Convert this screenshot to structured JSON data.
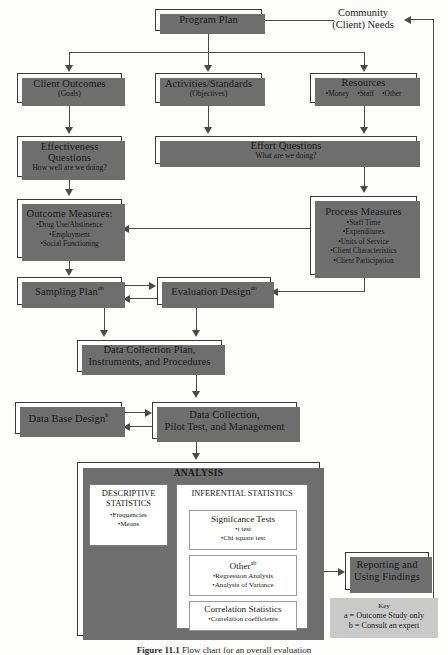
{
  "diagram": {
    "caption_label": "Figure 11.1",
    "caption_text": "Flow chart for an overall evaluation"
  },
  "nodes": {
    "program_plan": {
      "title": "Program Plan"
    },
    "community_needs": {
      "line1": "Community",
      "line2": "(Client) Needs"
    },
    "client_outcomes": {
      "title": "Client Outcomes",
      "sub": "(Goals)"
    },
    "activities_standards": {
      "title": "Activities/Standards",
      "sub": "(Objectives)"
    },
    "resources": {
      "title": "Resources",
      "bullets": [
        "•Money",
        "•Staff",
        "•Other"
      ]
    },
    "effectiveness_questions": {
      "line1": "Effectiveness",
      "line2": "Questions",
      "sub": "How well are we doing?"
    },
    "effort_questions": {
      "title": "Effort Questions",
      "sub": "What are we doing?"
    },
    "outcome_measures": {
      "title": "Outcome Measures:",
      "bullets": [
        "•Drug Use/Abstinence",
        "•Employment",
        "•Social Functioning"
      ]
    },
    "process_measures": {
      "title": "Process Measures",
      "bullets": [
        "•Staff Time",
        "•Expenditures",
        "•Units of Service",
        "•Client Characteristics",
        "•Client Participation"
      ]
    },
    "sampling_plan": {
      "title": "Sampling Plan",
      "superscript": "ab"
    },
    "evaluation_design": {
      "title": "Evaluation Design",
      "superscript": "ab"
    },
    "data_collection_plan": {
      "line1": "Data Collection Plan,",
      "line2": "Instruments, and Procedures"
    },
    "data_base_design": {
      "title": "Data Base Design",
      "superscript": "b"
    },
    "data_collection": {
      "line1": "Data Collection,",
      "line2": "Pilot Test, and Management"
    },
    "reporting": {
      "line1": "Reporting and",
      "line2": "Using Findings"
    }
  },
  "analysis": {
    "title": "ANALYSIS",
    "descriptive": {
      "heading_line1": "DESCRIPTIVE",
      "heading_line2": "STATISTICS",
      "bullets": [
        "•Frequencies",
        "•Means"
      ]
    },
    "inferential": {
      "heading": "INFERENTIAL STATISTICS",
      "groups": [
        {
          "heading": "Signifcance Tests",
          "superscript": "",
          "bullets": [
            "•t test",
            "•Chi square test"
          ]
        },
        {
          "heading": "Other",
          "superscript": "ab",
          "bullets": [
            "•Regression Analysis",
            "•Analysis of Variance"
          ]
        },
        {
          "heading": "Correlation Statistics",
          "superscript": "",
          "bullets": [
            "•Correlation coefficients"
          ]
        }
      ]
    }
  },
  "key": {
    "title": "Key",
    "line_a": "a = Outcome Study only",
    "line_b": "b = Consult an expert"
  },
  "colors": {
    "box_border": "#3a3a3a",
    "box_fill": "#ffffff",
    "shadow": "#6e6e6e",
    "connector": "#4a4a4a",
    "key_fill": "#c9c9c9",
    "page_bg": "#fdfdfb"
  }
}
